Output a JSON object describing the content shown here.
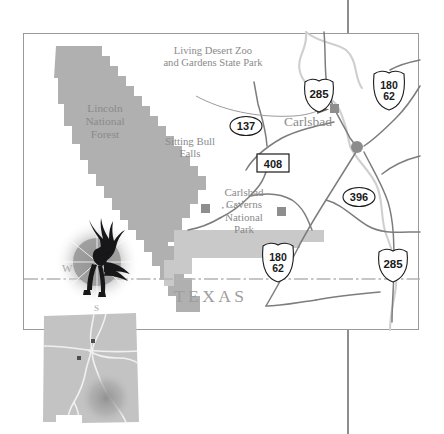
{
  "page": {
    "width": 444,
    "height": 434,
    "background": "#ffffff",
    "gutter_line_color": "#8d8d8d"
  },
  "map": {
    "frame": {
      "x": 23,
      "y": 33,
      "width": 396,
      "height": 297,
      "border_color": "#9a9a9a"
    },
    "colors": {
      "forest_fill": "#b0b0b0",
      "park_fill": "#c9c9c9",
      "road": "#7d7d7d",
      "river": "#cfcfcf",
      "label_text": "#8a8a8a",
      "marker": "#8e8e8e",
      "city_dot": "#8c8c8c",
      "state_border": "#b4b4b4"
    },
    "area_labels": [
      {
        "name": "living-desert-zoo",
        "text": "Living Desert Zoo\nand Gardens State Park",
        "x": 152,
        "y": 45,
        "size": 10.5,
        "align": "center",
        "width": 120
      },
      {
        "name": "lincoln-national-forest",
        "text": "Lincoln\nNational\nForest",
        "x": 78,
        "y": 104,
        "size": 11,
        "align": "center",
        "width": 60
      },
      {
        "name": "sitting-bull-falls",
        "text": "Sitting Bull\nFalls",
        "x": 160,
        "y": 138,
        "size": 10.5,
        "align": "center",
        "width": 62
      },
      {
        "name": "carlsbad-caverns-national-park",
        "text": "Carlsbad\nCaverns\nNational\nPark",
        "x": 215,
        "y": 190,
        "size": 11,
        "align": "center",
        "width": 58
      },
      {
        "name": "carlsbad-city",
        "text": "Carlsbad",
        "x": 285,
        "y": 117,
        "size": 13,
        "align": "left",
        "width": 72
      }
    ],
    "state_label": {
      "name": "texas-label",
      "text": "TEXAS",
      "x": 175,
      "y": 288,
      "size": 17
    },
    "compass": {
      "name": "compass-rose",
      "west_letter": "W",
      "south_letter": "S"
    },
    "highway_shields": [
      {
        "name": "shield-us-285-north",
        "type": "us",
        "lines": [
          "285"
        ],
        "x": 306,
        "y": 81
      },
      {
        "name": "shield-us-180-62-north",
        "type": "us",
        "lines": [
          "180",
          "62"
        ],
        "x": 375,
        "y": 75
      },
      {
        "name": "shield-state-137",
        "type": "state-oval",
        "lines": [
          "137"
        ],
        "x": 243,
        "y": 122
      },
      {
        "name": "shield-county-408",
        "type": "rect",
        "lines": [
          "408"
        ],
        "x": 270,
        "y": 161
      },
      {
        "name": "shield-state-396",
        "type": "state-oval",
        "lines": [
          "396"
        ],
        "x": 357,
        "y": 193
      },
      {
        "name": "shield-us-180-62-south",
        "type": "us",
        "lines": [
          "180",
          "62"
        ],
        "x": 275,
        "y": 246
      },
      {
        "name": "shield-us-285-south",
        "type": "us",
        "lines": [
          "285"
        ],
        "x": 392,
        "y": 255
      }
    ],
    "markers": [
      {
        "name": "marker-living-desert-zoo",
        "x": 325,
        "y": 108,
        "size": 9
      },
      {
        "name": "marker-sitting-bull-falls",
        "x": 198,
        "y": 172,
        "size": 9
      },
      {
        "name": "marker-carlsbad-caverns",
        "x": 274,
        "y": 211,
        "size": 9
      },
      {
        "name": "marker-carlsbad-city-dot",
        "x": 345,
        "y": 113,
        "size": 9
      }
    ]
  },
  "inset": {
    "name": "new-mexico-locator-inset",
    "state": "New Mexico",
    "fill": "#c3c3c3",
    "road_color": "#f0f0f0",
    "highlight_color": "#9c9c9c",
    "city_dots": 2
  }
}
